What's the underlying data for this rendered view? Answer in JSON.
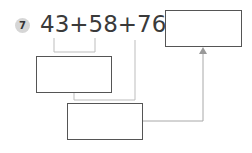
{
  "problem": {
    "number": "7",
    "expression": "43+58+76=",
    "terms": [
      "43",
      "58",
      "76"
    ],
    "operator": "+"
  },
  "boxes": {
    "answer": "",
    "first_sum": "",
    "second_sum": ""
  },
  "colors": {
    "badge": "#d6d6d6",
    "text": "#3a3a3a",
    "box_border": "#555555",
    "connector": "#b5b5b5",
    "arrow": "#999999"
  }
}
